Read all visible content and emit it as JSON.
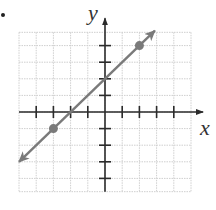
{
  "bullet": "•",
  "chart_data": {
    "type": "line",
    "title": "",
    "xlabel": "x",
    "ylabel": "y",
    "xlim": [
      -5,
      5
    ],
    "ylim": [
      -4.8,
      4.8
    ],
    "grid": true,
    "x_ticks": [
      -4,
      -3,
      -2,
      -1,
      1,
      2,
      3,
      4
    ],
    "y_ticks": [
      -4,
      -3,
      -2,
      -1,
      1,
      2,
      3,
      4
    ],
    "tick_labels_shown": false,
    "series": [
      {
        "name": "y = x + 2",
        "slope": 1,
        "intercept": 2,
        "line_start": [
          -5,
          -3
        ],
        "line_end": [
          2.9,
          4.9
        ],
        "arrows": "both",
        "marked_points": [
          [
            -3,
            -1
          ],
          [
            2,
            4
          ]
        ]
      }
    ],
    "colors": {
      "line": "#7a7a7a",
      "axis": "#2b2b2b",
      "grid": "#cfcfcf",
      "points": "#7a7a7a"
    }
  }
}
